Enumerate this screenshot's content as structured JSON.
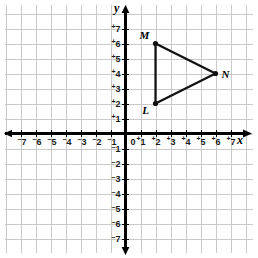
{
  "chart_data": {
    "type": "scatter",
    "title": "",
    "xlabel": "x",
    "ylabel": "y",
    "grid": true,
    "legend": false,
    "xlim": [
      -7.8,
      7.8
    ],
    "ylim": [
      -7.8,
      7.8
    ],
    "x_ticks": [
      -7,
      -6,
      -5,
      -4,
      -3,
      -2,
      -1,
      0,
      1,
      2,
      3,
      4,
      5,
      6,
      7
    ],
    "y_ticks": [
      7,
      6,
      5,
      4,
      3,
      2,
      1,
      0,
      -1,
      -2,
      -3,
      -4,
      -5,
      -6,
      -7
    ],
    "x_tick_labels": [
      "⁻7",
      "⁻6",
      "⁻5",
      "⁻4",
      "⁻3",
      "⁻2",
      "⁻1",
      "0",
      "⁺1",
      "⁺2",
      "⁺3",
      "⁺4",
      "⁺5",
      "⁺6",
      "⁺7"
    ],
    "y_tick_labels": [
      "⁺7",
      "⁺6",
      "⁺5",
      "⁺4",
      "⁺3",
      "⁺2",
      "⁺1",
      "0",
      "⁻1",
      "⁻2",
      "⁻3",
      "⁻4",
      "⁻5",
      "⁻6",
      "⁻7"
    ],
    "origin_label": "0",
    "points": [
      {
        "name": "M",
        "x": 2,
        "y": 6,
        "label": "M"
      },
      {
        "name": "N",
        "x": 6,
        "y": 4,
        "label": "N"
      },
      {
        "name": "L",
        "x": 2,
        "y": 2,
        "label": "L"
      }
    ],
    "edges": [
      {
        "from": "M",
        "to": "N"
      },
      {
        "from": "N",
        "to": "L"
      },
      {
        "from": "L",
        "to": "M"
      }
    ],
    "annotations": []
  },
  "figure": {
    "axis_x_label": "x",
    "axis_y_label": "y",
    "vertex_m_label": "M",
    "vertex_n_label": "N",
    "vertex_l_label": "L",
    "colors": {
      "grid": "#c9c9c9",
      "axis": "#000000",
      "shape": "#111111",
      "background": "#ffffff"
    }
  }
}
